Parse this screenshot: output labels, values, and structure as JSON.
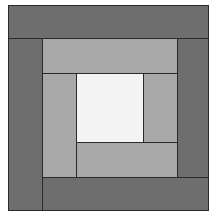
{
  "diagram": {
    "title": "",
    "type": "log-cabin-quilt-block",
    "colors": {
      "dark": "#6e6e6e",
      "light": "#a9a9a9",
      "center": "#f4f4f4",
      "seam": "#2a2a2a",
      "background": "#ffffff"
    },
    "pieces": [
      {
        "name": "outer-top-band",
        "tone": "dark",
        "x": 0,
        "y": 0,
        "w": 201,
        "h": 34
      },
      {
        "name": "outer-left-band",
        "tone": "dark",
        "x": 0,
        "y": 33,
        "w": 35,
        "h": 173
      },
      {
        "name": "outer-bottom-band",
        "tone": "dark",
        "x": 34,
        "y": 172,
        "w": 167,
        "h": 34
      },
      {
        "name": "outer-right-band",
        "tone": "dark",
        "x": 169,
        "y": 33,
        "w": 32,
        "h": 140
      },
      {
        "name": "inner-top-band",
        "tone": "light",
        "x": 34,
        "y": 33,
        "w": 136,
        "h": 36
      },
      {
        "name": "inner-left-band",
        "tone": "light",
        "x": 34,
        "y": 68,
        "w": 35,
        "h": 105
      },
      {
        "name": "inner-bottom-band",
        "tone": "light",
        "x": 68,
        "y": 137,
        "w": 102,
        "h": 36
      },
      {
        "name": "inner-right-band",
        "tone": "light",
        "x": 135,
        "y": 68,
        "w": 35,
        "h": 70
      },
      {
        "name": "center-square",
        "tone": "center",
        "x": 68,
        "y": 68,
        "w": 68,
        "h": 70
      }
    ]
  }
}
